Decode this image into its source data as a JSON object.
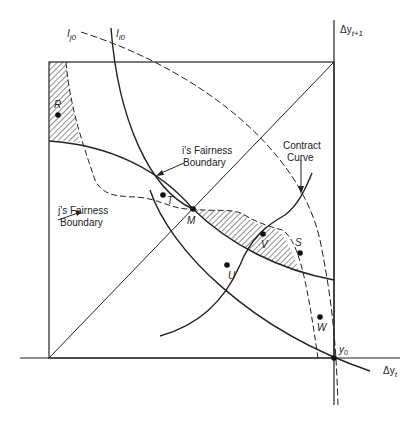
{
  "diagram": {
    "type": "edgeworth-box",
    "axes": {
      "x_label": "Δy",
      "x_sub": "t",
      "y_label": "Δy",
      "y_sub": "t+1",
      "origin_label": "y",
      "origin_sub": "0"
    },
    "curves": {
      "ij0": {
        "label": "I",
        "sub": "j0"
      },
      "ii0": {
        "label": "I",
        "sub": "i0"
      },
      "i_fairness": {
        "line1": "i's Fairness",
        "line2": "Boundary"
      },
      "j_fairness": {
        "line1": "j's Fairness",
        "line2": "Boundary"
      },
      "contract": {
        "line1": "Contract",
        "line2": "Curve"
      }
    },
    "points": [
      {
        "id": "R",
        "label": "R"
      },
      {
        "id": "T",
        "label": "T"
      },
      {
        "id": "M",
        "label": "M"
      },
      {
        "id": "V",
        "label": "V"
      },
      {
        "id": "S",
        "label": "S"
      },
      {
        "id": "U",
        "label": "U"
      },
      {
        "id": "W",
        "label": "W"
      }
    ],
    "colors": {
      "line": "#222222",
      "background": "#ffffff"
    }
  }
}
